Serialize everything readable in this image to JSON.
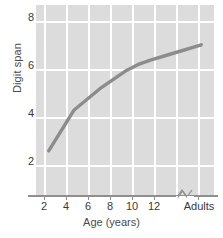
{
  "chart_data": {
    "type": "line",
    "title": "",
    "xlabel": "Age (years)",
    "ylabel": "Digit span",
    "x": [
      2,
      4,
      6,
      8,
      9,
      10,
      12,
      14
    ],
    "x_tick_labels": [
      "2",
      "4",
      "6",
      "8",
      "10",
      "12",
      "Adults"
    ],
    "x_tick_values": [
      2,
      4,
      6,
      8,
      10,
      12,
      14
    ],
    "y_tick_labels": [
      "8",
      "6",
      "4",
      "2"
    ],
    "y_tick_values": [
      8,
      6,
      4,
      2
    ],
    "xlim": [
      1,
      15
    ],
    "ylim": [
      0,
      8.6
    ],
    "grid": true,
    "legend": "none",
    "axis_break": {
      "present": true,
      "between": [
        "12",
        "Adults"
      ],
      "symbol": "zigzag-break"
    },
    "series": [
      {
        "name": "Digit span",
        "color": "#8c8c8c",
        "values": [
          2.0,
          3.85,
          4.8,
          5.6,
          5.9,
          6.1,
          6.45,
          6.8
        ]
      }
    ],
    "point_labels": [
      {
        "age": "2",
        "digit_span": 2.0
      },
      {
        "age": "4",
        "digit_span": 3.85
      },
      {
        "age": "6",
        "digit_span": 4.8
      },
      {
        "age": "8",
        "digit_span": 5.6
      },
      {
        "age": "9",
        "digit_span": 5.9
      },
      {
        "age": "10",
        "digit_span": 6.1
      },
      {
        "age": "12",
        "digit_span": 6.45
      },
      {
        "age": "Adults",
        "digit_span": 6.8
      }
    ]
  },
  "colors": {
    "panel_background": "#dcdcdc",
    "gridline": "#ffffff",
    "line": "#8c8c8c",
    "axis": "#8f8f8f",
    "text": "#3a3a3a"
  }
}
